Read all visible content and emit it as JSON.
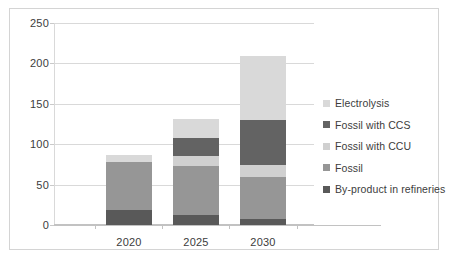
{
  "chart_data": {
    "type": "bar",
    "subtype": "stacked-column",
    "title": "",
    "xlabel": "",
    "ylabel": "",
    "categories": [
      "2020",
      "2025",
      "2030"
    ],
    "ylim": [
      0,
      250
    ],
    "yticks": [
      0,
      50,
      100,
      150,
      200,
      250
    ],
    "grid": true,
    "legend_position": "right",
    "series": [
      {
        "name": "By-product in refineries",
        "color": "#595959",
        "values": [
          18,
          13,
          8
        ]
      },
      {
        "name": "Fossil",
        "color": "#969696",
        "values": [
          60,
          60,
          52
        ]
      },
      {
        "name": "Fossil with CCU",
        "color": "#d0d0d0",
        "values": [
          0,
          13,
          14
        ]
      },
      {
        "name": "Fossil with CCS",
        "color": "#636363",
        "values": [
          0,
          22,
          56
        ]
      },
      {
        "name": "Electrolysis",
        "color": "#d9d9d9",
        "values": [
          9,
          23,
          79
        ]
      }
    ],
    "stack_order_bottom_to_top": [
      "By-product in refineries",
      "Fossil",
      "Fossil with CCU",
      "Fossil with CCS",
      "Electrolysis"
    ],
    "totals": [
      87,
      131,
      209
    ],
    "legend_order_top_to_bottom": [
      "Electrolysis",
      "Fossil with CCS",
      "Fossil with CCU",
      "Fossil",
      "By-product in refineries"
    ]
  }
}
